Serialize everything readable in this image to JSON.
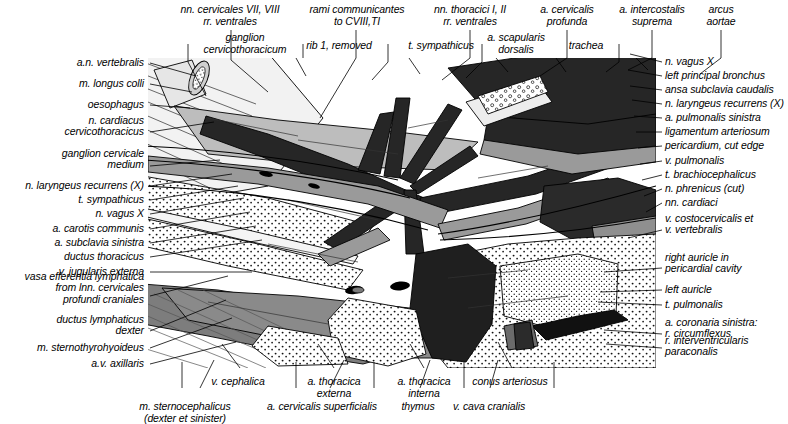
{
  "figure": {
    "kind": "anatomical-illustration",
    "colors": {
      "background": "#ffffff",
      "ink": "#000000",
      "artery_dark": "#2b2b2b",
      "vein_mid": "#6d6d6d",
      "muscle_light": "#b8b8b8",
      "fat_stipple": "#ffffff"
    }
  },
  "labels_top": [
    {
      "id": "nn-cervicales-7-8",
      "text": "nn. cervicales VII, VIII\nrr. ventrales",
      "x": 230,
      "y": 4,
      "align": "center"
    },
    {
      "id": "rami-communicantes",
      "text": "rami communicantes\nto CVIII,TI",
      "x": 357,
      "y": 4,
      "align": "center"
    },
    {
      "id": "nn-thoracici-1-2",
      "text": "nn. thoracici I, II\nrr. ventrales",
      "x": 470,
      "y": 4,
      "align": "center"
    },
    {
      "id": "a-cervicalis-profunda",
      "text": "a. cervicalis\nprofunda",
      "x": 567,
      "y": 4,
      "align": "center"
    },
    {
      "id": "a-intercostalis-suprema",
      "text": "a. intercostalis\nsuprema",
      "x": 652,
      "y": 4,
      "align": "center"
    },
    {
      "id": "arcus-aortae",
      "text": "arcus\naortae",
      "x": 721,
      "y": 4,
      "align": "center"
    },
    {
      "id": "ganglion-cervicothoracicum",
      "text": "ganglion\ncervicothoracicum",
      "x": 245,
      "y": 32,
      "align": "center"
    },
    {
      "id": "rib-1-removed",
      "text": "rib 1, removed",
      "x": 339,
      "y": 40,
      "align": "center"
    },
    {
      "id": "t-sympathicus-top",
      "text": "t. sympathicus",
      "x": 441,
      "y": 40,
      "align": "center"
    },
    {
      "id": "a-scapularis-dorsalis",
      "text": "a. scapularis\ndorsalis",
      "x": 516,
      "y": 32,
      "align": "center"
    },
    {
      "id": "trachea",
      "text": "trachea",
      "x": 586,
      "y": 40,
      "align": "center"
    }
  ],
  "labels_left": [
    {
      "id": "a-n-vertebralis",
      "text": "a.n. vertebralis",
      "y": 63,
      "lines": 1
    },
    {
      "id": "m-longus-colli",
      "text": "m. longus colli",
      "y": 84,
      "lines": 1
    },
    {
      "id": "oesophagus",
      "text": "oesophagus",
      "y": 105,
      "lines": 1
    },
    {
      "id": "n-cardiacus-cervicothoracicus",
      "text": "n. cardiacus\ncervicothoracicus",
      "y": 126,
      "lines": 2
    },
    {
      "id": "ganglion-cervicale-medium",
      "text": "ganglion cervicale\nmedium",
      "y": 159,
      "lines": 2
    },
    {
      "id": "n-laryngeus-recurrens-left",
      "text": "n. laryngeus recurrens (X)",
      "y": 186,
      "lines": 1
    },
    {
      "id": "t-sympathicus-left",
      "text": "t. sympathicus",
      "y": 200,
      "lines": 1
    },
    {
      "id": "n-vagus-x-left",
      "text": "n. vagus X",
      "y": 214,
      "lines": 1
    },
    {
      "id": "a-carotis-communis",
      "text": "a. carotis communis",
      "y": 229,
      "lines": 1
    },
    {
      "id": "a-subclavia-sinistra",
      "text": "a. subclavia sinistra",
      "y": 243,
      "lines": 1
    },
    {
      "id": "ductus-thoracicus",
      "text": "ductus thoracicus",
      "y": 257,
      "lines": 1
    },
    {
      "id": "v-jugularis-externa",
      "text": "v. jugularis externa",
      "y": 272,
      "lines": 1
    },
    {
      "id": "vasa-efferentia-lymphatica",
      "text": "vasa efferentia lymphatica\nfrom lnn. cervicales\nprofundi craniales",
      "y": 288,
      "lines": 3
    },
    {
      "id": "ductus-lymphaticus-dexter",
      "text": "ductus lymphaticus\ndexter",
      "y": 325,
      "lines": 2
    },
    {
      "id": "m-sternothyrohyoideus",
      "text": "m. sternothyrohyoideus",
      "y": 348,
      "lines": 1
    },
    {
      "id": "a-v-axillaris",
      "text": "a.v. axillaris",
      "y": 364,
      "lines": 1
    }
  ],
  "labels_right": [
    {
      "id": "n-vagus-x-right",
      "text": "n. vagus X",
      "y": 62,
      "lines": 1
    },
    {
      "id": "left-principal-bronchus",
      "text": "left principal bronchus",
      "y": 76,
      "lines": 1
    },
    {
      "id": "ansa-subclavia-caudalis",
      "text": "ansa subclavia caudalis",
      "y": 90,
      "lines": 1
    },
    {
      "id": "n-laryngeus-recurrens-right",
      "text": "n. laryngeus recurrens (X)",
      "y": 104,
      "lines": 1
    },
    {
      "id": "a-pulmonalis-sinistra",
      "text": "a. pulmonalis sinistra",
      "y": 118,
      "lines": 1
    },
    {
      "id": "ligamentum-arteriosum",
      "text": "ligamentum arteriosum",
      "y": 132,
      "lines": 1
    },
    {
      "id": "pericardium-cut-edge",
      "text": "pericardium, cut edge",
      "y": 146,
      "lines": 1
    },
    {
      "id": "v-pulmonalis",
      "text": "v. pulmonalis",
      "y": 161,
      "lines": 1
    },
    {
      "id": "t-brachiocephalicus",
      "text": "t. brachiocephalicus",
      "y": 175,
      "lines": 1
    },
    {
      "id": "n-phrenicus-cut",
      "text": "n. phrenicus (cut)",
      "y": 189,
      "lines": 1
    },
    {
      "id": "nn-cardiaci",
      "text": "nn. cardiaci",
      "y": 203,
      "lines": 1
    },
    {
      "id": "v-costocervicalis-vertebralis",
      "text": "v. costocervicalis et\nv. vertebralis",
      "y": 224,
      "lines": 2
    },
    {
      "id": "right-auricle",
      "text": "right auricle in\npericardial cavity",
      "y": 263,
      "lines": 2
    },
    {
      "id": "left-auricle",
      "text": "left auricle",
      "y": 290,
      "lines": 1
    },
    {
      "id": "t-pulmonalis",
      "text": "t. pulmonalis",
      "y": 305,
      "lines": 1
    },
    {
      "id": "a-coronaria-sinistra",
      "text": "a. coronaria sinistra:",
      "y": 323,
      "lines": 1
    },
    {
      "id": "r-circumflexus",
      "text": "r. circumflexus",
      "y": 334,
      "lines": 1
    },
    {
      "id": "r-interventricularis-paraconalis",
      "text": "r. interventricularis\nparaconalis",
      "y": 346,
      "lines": 2
    }
  ],
  "labels_bottom_row1": [
    {
      "id": "v-cephalica",
      "text": "v. cephalica",
      "x": 238,
      "y": 376,
      "align": "center"
    },
    {
      "id": "a-thoracica-externa",
      "text": "a. thoracica\nexterna",
      "x": 334,
      "y": 376,
      "align": "center"
    },
    {
      "id": "a-thoracica-interna",
      "text": "a. thoracica\ninterna",
      "x": 424,
      "y": 376,
      "align": "center"
    },
    {
      "id": "conus-arteriosus",
      "text": "conus arteriosus",
      "x": 510,
      "y": 376,
      "align": "center"
    }
  ],
  "labels_bottom_row2": [
    {
      "id": "m-sternocephalicus",
      "text": "m. sternocephalicus\n(dexter et sinister)",
      "x": 185,
      "y": 401,
      "align": "center"
    },
    {
      "id": "a-cervicalis-superficialis",
      "text": "a. cervicalis superficialis",
      "x": 322,
      "y": 401,
      "align": "center"
    },
    {
      "id": "thymus",
      "text": "thymus",
      "x": 418,
      "y": 401,
      "align": "center"
    },
    {
      "id": "v-cava-cranialis",
      "text": "v. cava cranialis",
      "x": 489,
      "y": 401,
      "align": "center"
    }
  ]
}
